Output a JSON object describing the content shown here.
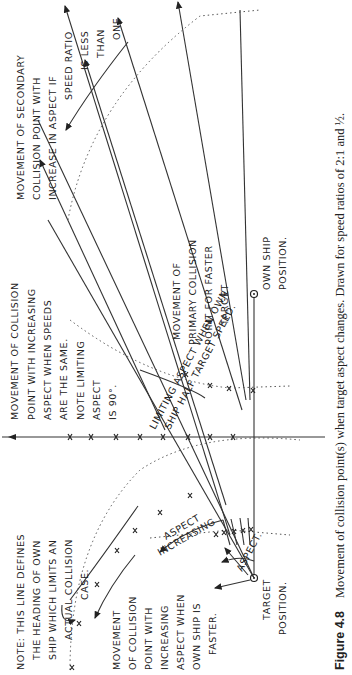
{
  "figure": {
    "label": "Figure 4.8",
    "caption": "Movement of collision point(s) when target aspect changes. Drawn for speed ratios of 2:1 and ½."
  },
  "annotations": {
    "secondary": [
      "MOVEMENT OF SECONDARY",
      "COLLISION POINT WITH",
      "INCREASE IN ASPECT IF",
      "SPEED RATIO",
      "IS LESS",
      "THAN",
      "ONE"
    ],
    "same_speed": [
      "MOVEMENT OF COLLISION",
      "POINT WITH INCREASING",
      "ASPECT WHEN SPEEDS",
      "ARE THE SAME.",
      "NOTE LIMITING",
      "ASPECT",
      "IS 90°."
    ],
    "limiting_half": "LIMITING ASPECT WHEN OWN",
    "limiting_half_2": "SHIP HALF TARGET SPEED.",
    "primary": [
      "MOVEMENT OF",
      "PRIMARY COLLISION",
      "POINT FOR FASTER",
      "TARGET"
    ],
    "own_ship": [
      "OWN SHIP",
      "POSITION."
    ],
    "note_line": [
      "NOTE: THIS LINE DEFINES",
      "THE HEADING OF OWN",
      "SHIP WHICH LIMITS AN",
      "ACTUAL COLLISION",
      "CASE."
    ],
    "faster": [
      "MOVEMENT",
      "OF COLLISION",
      "POINT WITH",
      "INCREASING",
      "ASPECT WHEN",
      "OWN SHIP IS",
      "FASTER."
    ],
    "aspect_increasing": [
      "ASPECT",
      "INCREASING"
    ],
    "aspect": "ASPECT.",
    "target": [
      "TARGET",
      "POSITION."
    ]
  },
  "orientation": "rotated 90° clockwise (page printed landscape)"
}
